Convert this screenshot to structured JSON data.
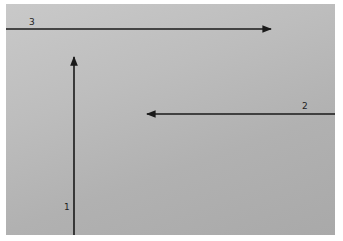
{
  "figure": {
    "background_color": "#bdbdbd",
    "arrow_color": "#1a1a1a",
    "arrows": [
      {
        "id": "1",
        "label": "1",
        "direction": "up",
        "x1": 74,
        "y1": 235,
        "x2": 74,
        "y2": 56,
        "label_x": 64,
        "label_y": 204
      },
      {
        "id": "2",
        "label": "2",
        "direction": "left",
        "x1": 335,
        "y1": 114,
        "x2": 146,
        "y2": 114,
        "label_x": 302,
        "label_y": 103
      },
      {
        "id": "3",
        "label": "3",
        "direction": "right",
        "x1": 6,
        "y1": 29,
        "x2": 272,
        "y2": 29,
        "label_x": 29,
        "label_y": 19
      }
    ]
  }
}
